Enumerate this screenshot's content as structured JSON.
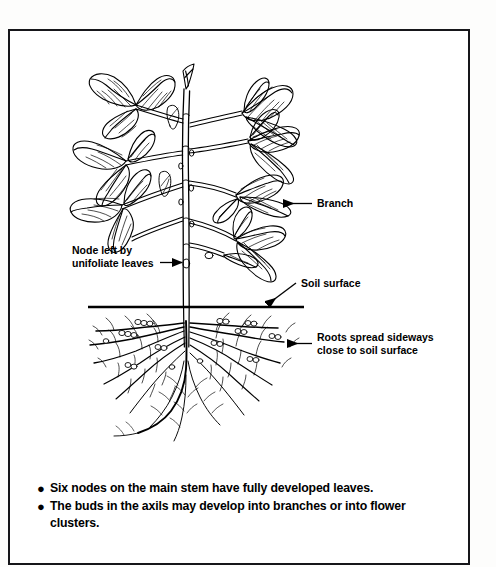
{
  "figure": {
    "line_color": "#000000",
    "background_color": "#ffffff",
    "frame_color": "#16161a"
  },
  "callouts": [
    {
      "id": "branch",
      "label": "Branch",
      "label_x": 310,
      "label_y": 172,
      "arrow": "left"
    },
    {
      "id": "node-unifoliate",
      "label_line1": "Node left by",
      "label_line2": "unifoliate leaves",
      "label_x": 62,
      "label_y": 221,
      "arrow": "right"
    },
    {
      "id": "soil-surface",
      "label": "Soil surface",
      "label_x": 288,
      "label_y": 262,
      "arrow": "down-left"
    },
    {
      "id": "roots-spread",
      "label_line1": "Roots spread sideways",
      "label_line2": "close to soil surface",
      "label_x": 310,
      "label_y": 312,
      "arrow": "left"
    }
  ],
  "notes": {
    "bullet_char": "●",
    "items": [
      {
        "lines": [
          "Six nodes on the main stem have fully developed leaves."
        ]
      },
      {
        "lines": [
          "The buds in the axils may develop into branches or into flower",
          "clusters."
        ]
      }
    ]
  }
}
